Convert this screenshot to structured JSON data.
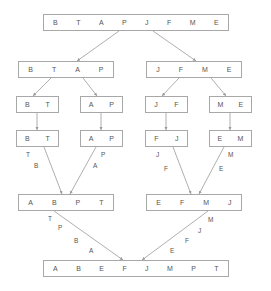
{
  "diagram": {
    "colors": {
      "box_border": "#a8a8a8",
      "text": "#555555",
      "edge": "#9a9a9a",
      "background": "#ffffff"
    },
    "levels": [
      {
        "name": "level-0-split",
        "boxes": [
          {
            "id": "root",
            "items": [
              "B",
              "T",
              "A",
              "P",
              "J",
              "F",
              "M",
              "E"
            ],
            "x": 43,
            "y": 14,
            "w": 186,
            "h": 17
          }
        ]
      },
      {
        "name": "level-1-split",
        "boxes": [
          {
            "id": "split-left",
            "items": [
              "B",
              "T",
              "A",
              "P"
            ],
            "x": 18,
            "y": 61,
            "w": 96,
            "h": 17
          },
          {
            "id": "split-right",
            "items": [
              "J",
              "F",
              "M",
              "E"
            ],
            "x": 146,
            "y": 61,
            "w": 96,
            "h": 17
          }
        ]
      },
      {
        "name": "level-2-split",
        "boxes": [
          {
            "id": "split-bt",
            "items": [
              "B",
              "T"
            ],
            "x": 16,
            "y": 96,
            "w": 43,
            "h": 17
          },
          {
            "id": "split-ap",
            "items": [
              "A",
              "P"
            ],
            "x": 80,
            "y": 96,
            "w": 43,
            "h": 17
          },
          {
            "id": "split-jf",
            "items": [
              "J",
              "F"
            ],
            "x": 145,
            "y": 96,
            "w": 43,
            "h": 17
          },
          {
            "id": "split-me",
            "items": [
              "M",
              "E"
            ],
            "x": 209,
            "y": 96,
            "w": 43,
            "h": 17
          }
        ]
      },
      {
        "name": "level-2-merge",
        "boxes": [
          {
            "id": "merge-bt",
            "items": [
              "B",
              "T"
            ],
            "x": 16,
            "y": 130,
            "w": 43,
            "h": 17
          },
          {
            "id": "merge-ap",
            "items": [
              "A",
              "P"
            ],
            "x": 80,
            "y": 130,
            "w": 43,
            "h": 17
          },
          {
            "id": "merge-fj",
            "items": [
              "F",
              "J"
            ],
            "x": 145,
            "y": 130,
            "w": 43,
            "h": 17
          },
          {
            "id": "merge-em",
            "items": [
              "E",
              "M"
            ],
            "x": 209,
            "y": 130,
            "w": 43,
            "h": 17
          }
        ]
      },
      {
        "name": "level-1-merge",
        "boxes": [
          {
            "id": "merge-abpt",
            "items": [
              "A",
              "B",
              "P",
              "T"
            ],
            "x": 18,
            "y": 194,
            "w": 96,
            "h": 17
          },
          {
            "id": "merge-efmj",
            "items": [
              "E",
              "F",
              "M",
              "J"
            ],
            "x": 146,
            "y": 194,
            "w": 96,
            "h": 17
          }
        ]
      },
      {
        "name": "level-0-merge",
        "boxes": [
          {
            "id": "final",
            "items": [
              "A",
              "B",
              "E",
              "F",
              "J",
              "M",
              "P",
              "T"
            ],
            "x": 43,
            "y": 260,
            "w": 186,
            "h": 17
          }
        ]
      }
    ],
    "edges": [
      {
        "id": "root-to-left",
        "x1": 119,
        "y1": 31,
        "x2": 77,
        "y2": 61,
        "arrow": true
      },
      {
        "id": "root-to-right",
        "x1": 153,
        "y1": 31,
        "x2": 196,
        "y2": 61,
        "arrow": true
      },
      {
        "id": "l1left-to-bt",
        "x1": 51,
        "y1": 78,
        "x2": 33,
        "y2": 96,
        "arrow": true
      },
      {
        "id": "l1left-to-ap",
        "x1": 83,
        "y1": 78,
        "x2": 97,
        "y2": 96,
        "arrow": true
      },
      {
        "id": "l1right-to-jf",
        "x1": 179,
        "y1": 78,
        "x2": 162,
        "y2": 96,
        "arrow": true
      },
      {
        "id": "l1right-to-me",
        "x1": 211,
        "y1": 78,
        "x2": 226,
        "y2": 96,
        "arrow": true
      },
      {
        "id": "bt-down",
        "x1": 37,
        "y1": 113,
        "x2": 37,
        "y2": 130,
        "arrow": true
      },
      {
        "id": "ap-down",
        "x1": 101,
        "y1": 113,
        "x2": 101,
        "y2": 130,
        "arrow": true
      },
      {
        "id": "jf-down",
        "x1": 166,
        "y1": 113,
        "x2": 166,
        "y2": 130,
        "arrow": true
      },
      {
        "id": "me-down",
        "x1": 230,
        "y1": 113,
        "x2": 230,
        "y2": 130,
        "arrow": true
      },
      {
        "id": "bt-to-merge",
        "x1": 44,
        "y1": 147,
        "x2": 62,
        "y2": 194,
        "arrow": true
      },
      {
        "id": "ap-to-merge",
        "x1": 96,
        "y1": 147,
        "x2": 70,
        "y2": 194,
        "arrow": true
      },
      {
        "id": "fj-to-merge",
        "x1": 173,
        "y1": 147,
        "x2": 191,
        "y2": 194,
        "arrow": true
      },
      {
        "id": "em-to-merge",
        "x1": 224,
        "y1": 147,
        "x2": 199,
        "y2": 194,
        "arrow": true
      },
      {
        "id": "abpt-to-final",
        "x1": 54,
        "y1": 211,
        "x2": 123,
        "y2": 260,
        "arrow": true
      },
      {
        "id": "efmj-to-final",
        "x1": 208,
        "y1": 211,
        "x2": 142,
        "y2": 260,
        "arrow": true
      }
    ],
    "edge_labels": [
      {
        "id": "lbl-bt-t",
        "text": "T",
        "x": 26,
        "y": 152
      },
      {
        "id": "lbl-bt-b",
        "text": "B",
        "x": 34,
        "y": 163
      },
      {
        "id": "lbl-ap-p",
        "text": "P",
        "x": 101,
        "y": 152
      },
      {
        "id": "lbl-ap-a",
        "text": "A",
        "x": 93,
        "y": 163
      },
      {
        "id": "lbl-fj-j",
        "text": "J",
        "x": 156,
        "y": 152
      },
      {
        "id": "lbl-fj-f",
        "text": "F",
        "x": 164,
        "y": 166
      },
      {
        "id": "lbl-em-m",
        "text": "M",
        "x": 228,
        "y": 152
      },
      {
        "id": "lbl-em-e",
        "text": "E",
        "x": 219,
        "y": 166
      },
      {
        "id": "lbl-abpt-t",
        "text": "T",
        "x": 48,
        "y": 216
      },
      {
        "id": "lbl-abpt-p",
        "text": "P",
        "x": 58,
        "y": 225
      },
      {
        "id": "lbl-abpt-b",
        "text": "B",
        "x": 74,
        "y": 238
      },
      {
        "id": "lbl-abpt-a",
        "text": "A",
        "x": 89,
        "y": 248
      },
      {
        "id": "lbl-efmj-m",
        "text": "M",
        "x": 208,
        "y": 217
      },
      {
        "id": "lbl-efmj-j",
        "text": "J",
        "x": 198,
        "y": 228
      },
      {
        "id": "lbl-efmj-f",
        "text": "F",
        "x": 185,
        "y": 238
      },
      {
        "id": "lbl-efmj-e",
        "text": "E",
        "x": 170,
        "y": 248
      }
    ]
  }
}
